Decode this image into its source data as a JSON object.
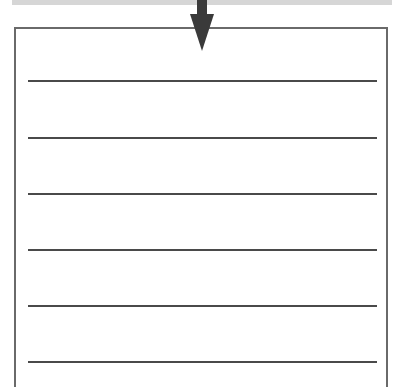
{
  "diagram": {
    "top_bar": {
      "color": "#d6d6d6"
    },
    "arrow": {
      "direction": "down",
      "color": "#3a3a3a"
    },
    "box": {
      "border_color": "#6a6a6a"
    },
    "lines": [
      {
        "y": 80
      },
      {
        "y": 137
      },
      {
        "y": 193
      },
      {
        "y": 249
      },
      {
        "y": 305
      },
      {
        "y": 361
      }
    ],
    "line_color": "#4a4a4a"
  }
}
